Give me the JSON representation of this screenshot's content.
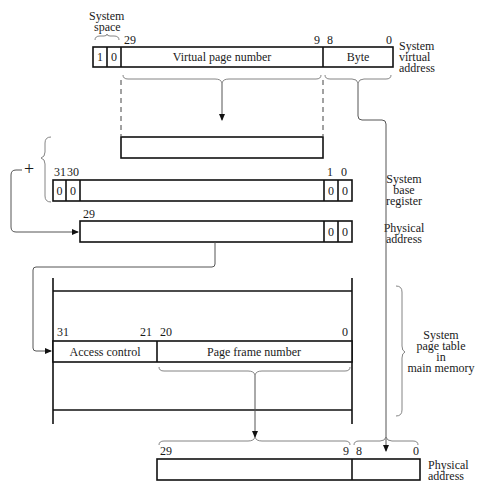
{
  "system_virtual_address": {
    "label_lines": [
      "System",
      "virtual",
      "address"
    ],
    "system_space_label_lines": [
      "System",
      "space"
    ],
    "bit_labels": {
      "b29": "29",
      "b9": "9",
      "b8": "8",
      "b0": "0"
    },
    "cells": [
      "1",
      "0"
    ],
    "fields": {
      "vpn": "Virtual page number",
      "byte": "Byte"
    }
  },
  "system_base_register": {
    "label_lines": [
      "System",
      "base",
      "register"
    ],
    "bit_labels": {
      "b31": "31",
      "b30": "30",
      "b1": "1",
      "b0": "0"
    },
    "left_cells": [
      "0",
      "0"
    ],
    "right_cells": [
      "0",
      "0"
    ],
    "plus": "+"
  },
  "physical_address_intermediate": {
    "label_lines": [
      "Physical",
      "address"
    ],
    "bit_labels": {
      "b29": "29"
    },
    "right_cells": [
      "0",
      "0"
    ]
  },
  "page_table": {
    "label_lines": [
      "System",
      "page table",
      "in",
      "main memory"
    ],
    "bit_labels": {
      "b31": "31",
      "b21": "21",
      "b20": "20",
      "b0": "0"
    },
    "fields": {
      "access": "Access control",
      "pfn": "Page frame number"
    }
  },
  "physical_address_final": {
    "label_lines": [
      "Physical",
      "address"
    ],
    "bit_labels": {
      "b29": "29",
      "b9": "9",
      "b8": "8",
      "b0": "0"
    }
  }
}
